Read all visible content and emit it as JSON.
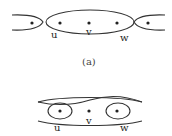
{
  "figure_a": {
    "caption": "(a)",
    "labels": {
      "u": "u",
      "v": "v",
      "w": "w"
    }
  },
  "figure_b": {
    "labels": {
      "u": "u",
      "v": "v",
      "w": "w"
    }
  },
  "colors": {
    "stroke": "#333333",
    "background": "#ffffff"
  }
}
